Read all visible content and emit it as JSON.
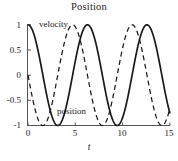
{
  "figure": {
    "title": "Position",
    "background_color": "#ffffff",
    "foreground_color": "#1a1a1a"
  },
  "annotations": {
    "velocity_label": "velocity",
    "position_label": "position"
  },
  "axes": {
    "x_title": "t",
    "x_tick_labels": [
      "0",
      "5",
      "10",
      "15"
    ],
    "y_tick_labels": [
      "1",
      "0.5",
      "0",
      "-0.5",
      "-1"
    ]
  },
  "chart_data": {
    "type": "line",
    "title": "Position",
    "xlabel": "t",
    "ylabel": "",
    "xlim": [
      0,
      15
    ],
    "ylim": [
      -1,
      1
    ],
    "xticks": [
      0,
      5,
      10,
      15
    ],
    "yticks": [
      -1,
      -0.5,
      0,
      0.5,
      1
    ],
    "grid": false,
    "legend": "inline-annotations",
    "series": [
      {
        "name": "position",
        "style": "solid",
        "color": "#1a1a1a",
        "expression": "cos(t)",
        "annotation": "position",
        "x": [
          0,
          0.5,
          1,
          1.5,
          2,
          2.5,
          3,
          3.5,
          4,
          4.5,
          5,
          5.5,
          6,
          6.5,
          7,
          7.5,
          8,
          8.5,
          9,
          9.5,
          10,
          10.5,
          11,
          11.5,
          12,
          12.5,
          13,
          13.5,
          14,
          14.5,
          15
        ],
        "values": [
          1,
          0.878,
          0.54,
          0.071,
          -0.416,
          -0.801,
          -0.99,
          -0.936,
          -0.654,
          -0.211,
          0.284,
          0.709,
          0.96,
          0.977,
          0.754,
          0.347,
          -0.146,
          -0.602,
          -0.911,
          -0.997,
          -0.839,
          -0.483,
          -0.004,
          0.476,
          0.844,
          0.998,
          0.907,
          0.595,
          0.137,
          -0.352,
          -0.76
        ]
      },
      {
        "name": "velocity",
        "style": "dashed",
        "color": "#1a1a1a",
        "expression": "-sin(t)",
        "annotation": "velocity",
        "x": [
          0,
          0.5,
          1,
          1.5,
          2,
          2.5,
          3,
          3.5,
          4,
          4.5,
          5,
          5.5,
          6,
          6.5,
          7,
          7.5,
          8,
          8.5,
          9,
          9.5,
          10,
          10.5,
          11,
          11.5,
          12,
          12.5,
          13,
          13.5,
          14,
          14.5,
          15
        ],
        "values": [
          0,
          -0.479,
          -0.841,
          -0.997,
          -0.909,
          -0.599,
          -0.141,
          0.351,
          0.757,
          0.978,
          0.959,
          0.706,
          0.279,
          -0.215,
          -0.657,
          -0.938,
          -0.989,
          -0.798,
          -0.412,
          0.075,
          0.544,
          0.88,
          1.0,
          0.879,
          0.537,
          0.066,
          -0.42,
          -0.804,
          -0.991,
          -0.935,
          -0.65
        ]
      }
    ]
  }
}
